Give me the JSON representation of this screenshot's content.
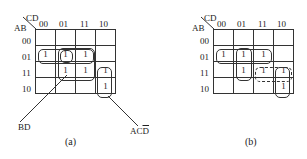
{
  "maps": [
    {
      "id": "a",
      "caption": "(a)",
      "row_var": "AB",
      "col_var": "CD",
      "col_labels": [
        "00",
        "01",
        "11",
        "10"
      ],
      "row_labels": [
        "00",
        "01",
        "11",
        "10"
      ],
      "cells": [
        [
          "",
          "",
          "",
          ""
        ],
        [
          "1",
          "1",
          "1",
          ""
        ],
        [
          "",
          "1",
          "1",
          "1"
        ],
        [
          "",
          "",
          "",
          "1"
        ]
      ],
      "loops": [
        {
          "name": "row-01-loop",
          "rows": [
            1,
            1
          ],
          "cols": [
            0,
            2
          ],
          "style": "solid"
        },
        {
          "name": "bd-loop",
          "rows": [
            1,
            2
          ],
          "cols": [
            1,
            2
          ],
          "style": "solid"
        },
        {
          "name": "acd-bar-loop",
          "rows": [
            2,
            3
          ],
          "cols": [
            3,
            3
          ],
          "style": "solid"
        },
        {
          "name": "a-b-c-bar-d-loop",
          "rows": [
            1,
            1
          ],
          "cols": [
            1,
            1
          ],
          "style": "solid"
        }
      ],
      "annotations": [
        {
          "name": "bd-label",
          "text": "BD"
        },
        {
          "name": "acd-bar-label",
          "text_plain": "AC",
          "text_over": "D"
        }
      ]
    },
    {
      "id": "b",
      "caption": "(b)",
      "row_var": "AB",
      "col_var": "CD",
      "col_labels": [
        "00",
        "01",
        "11",
        "10"
      ],
      "row_labels": [
        "00",
        "01",
        "11",
        "10"
      ],
      "cells": [
        [
          "",
          "",
          "",
          ""
        ],
        [
          "1",
          "1",
          "1",
          ""
        ],
        [
          "",
          "1",
          "1",
          "1"
        ],
        [
          "",
          "",
          "",
          "1"
        ]
      ],
      "loops": [
        {
          "name": "row-01-loop",
          "rows": [
            1,
            1
          ],
          "cols": [
            0,
            2
          ],
          "style": "solid"
        },
        {
          "name": "col-01-loop",
          "rows": [
            1,
            2
          ],
          "cols": [
            1,
            1
          ],
          "style": "solid"
        },
        {
          "name": "abc-dashed-loop",
          "rows": [
            2,
            2
          ],
          "cols": [
            2,
            3
          ],
          "style": "dashed"
        },
        {
          "name": "acd-bar-loop",
          "rows": [
            2,
            3
          ],
          "cols": [
            3,
            3
          ],
          "style": "solid"
        }
      ]
    }
  ]
}
